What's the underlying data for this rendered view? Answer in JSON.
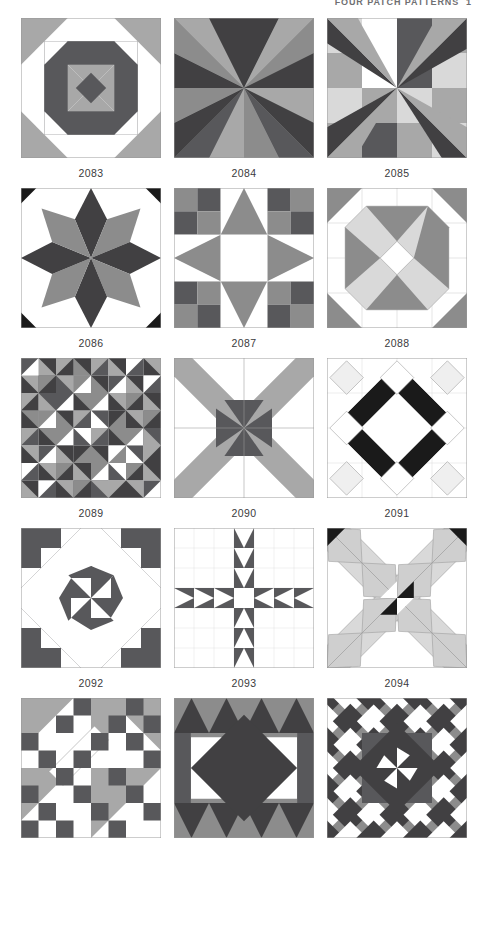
{
  "page": {
    "running_head": "FOUR PATCH PATTERNS",
    "folio": "1",
    "width": 488,
    "height": 927,
    "background": "#ffffff"
  },
  "palette": {
    "white": "#ffffff",
    "light_gray": "#d9d9d9",
    "mid_gray": "#a8a8a8",
    "gray": "#8c8c8c",
    "dark_gray": "#58585b",
    "charcoal": "#414042",
    "black": "#1a1a1a",
    "outline": "#9a9a9a",
    "caption_color": "#3a3a3c"
  },
  "chart_data": {
    "type": "table",
    "title": "Four Patch Patterns",
    "columns": 3,
    "rows": 5,
    "categories": [
      "2083",
      "2084",
      "2085",
      "2086",
      "2087",
      "2088",
      "2089",
      "2090",
      "2091",
      "2092",
      "2093",
      "2094",
      "",
      "",
      ""
    ],
    "values": [
      2083,
      2084,
      2085,
      2086,
      2087,
      2088,
      2089,
      2090,
      2091,
      2092,
      2093,
      2094,
      null,
      null,
      null
    ],
    "xlabel": "",
    "ylabel": "",
    "legend": []
  },
  "blocks": [
    {
      "id": "2083",
      "label": "2083",
      "name": "churn-dash-cross-block",
      "grid": 6,
      "colors_used": [
        "#ffffff",
        "#a8a8a8",
        "#58585b"
      ]
    },
    {
      "id": "2084",
      "label": "2084",
      "name": "four-quadrant-ray-pinwheel-block",
      "grid": 2,
      "colors_used": [
        "#a8a8a8",
        "#58585b",
        "#414042",
        "#8c8c8c"
      ]
    },
    {
      "id": "2085",
      "label": "2085",
      "name": "rotating-star-ray-block",
      "grid": 4,
      "colors_used": [
        "#ffffff",
        "#d9d9d9",
        "#a8a8a8",
        "#58585b",
        "#414042"
      ]
    },
    {
      "id": "2086",
      "label": "2086",
      "name": "eight-point-lemoyne-star-block",
      "grid": 4,
      "colors_used": [
        "#ffffff",
        "#8c8c8c",
        "#414042",
        "#1a1a1a"
      ]
    },
    {
      "id": "2087",
      "label": "2087",
      "name": "checkerboard-corner-star-block",
      "grid": 6,
      "colors_used": [
        "#ffffff",
        "#8c8c8c",
        "#58585b"
      ]
    },
    {
      "id": "2088",
      "label": "2088",
      "name": "octagon-medallion-block",
      "grid": 4,
      "colors_used": [
        "#ffffff",
        "#d9d9d9",
        "#8c8c8c"
      ]
    },
    {
      "id": "2089",
      "label": "2089",
      "name": "half-square-triangle-mosaic-block",
      "grid": 8,
      "colors_used": [
        "#ffffff",
        "#a8a8a8",
        "#8c8c8c",
        "#58585b",
        "#414042"
      ]
    },
    {
      "id": "2090",
      "label": "2090",
      "name": "diagonal-ribbon-cross-block",
      "grid": 4,
      "colors_used": [
        "#ffffff",
        "#a8a8a8",
        "#58585b"
      ]
    },
    {
      "id": "2091",
      "label": "2091",
      "name": "diamond-ring-block",
      "grid": 4,
      "colors_used": [
        "#ffffff",
        "#f2f2f2",
        "#1a1a1a"
      ]
    },
    {
      "id": "2092",
      "label": "2092",
      "name": "bears-paw-pinwheel-block",
      "grid": 7,
      "colors_used": [
        "#ffffff",
        "#58585b"
      ]
    },
    {
      "id": "2093",
      "label": "2093",
      "name": "flying-geese-cross-block",
      "grid": 7,
      "colors_used": [
        "#ffffff",
        "#58585b"
      ]
    },
    {
      "id": "2094",
      "label": "2094",
      "name": "x-triangle-band-block",
      "grid": 6,
      "colors_used": [
        "#ffffff",
        "#d9d9d9",
        "#1a1a1a"
      ]
    },
    {
      "id": "b13",
      "label": "",
      "name": "diagonal-checkerboard-block",
      "grid": 8,
      "colors_used": [
        "#ffffff",
        "#a8a8a8",
        "#58585b"
      ]
    },
    {
      "id": "b14",
      "label": "",
      "name": "hourglass-diamond-block",
      "grid": 4,
      "colors_used": [
        "#ffffff",
        "#8c8c8c",
        "#414042"
      ]
    },
    {
      "id": "b15",
      "label": "",
      "name": "on-point-diamond-medallion-block",
      "grid": 6,
      "colors_used": [
        "#ffffff",
        "#8c8c8c",
        "#58585b",
        "#414042"
      ]
    }
  ]
}
